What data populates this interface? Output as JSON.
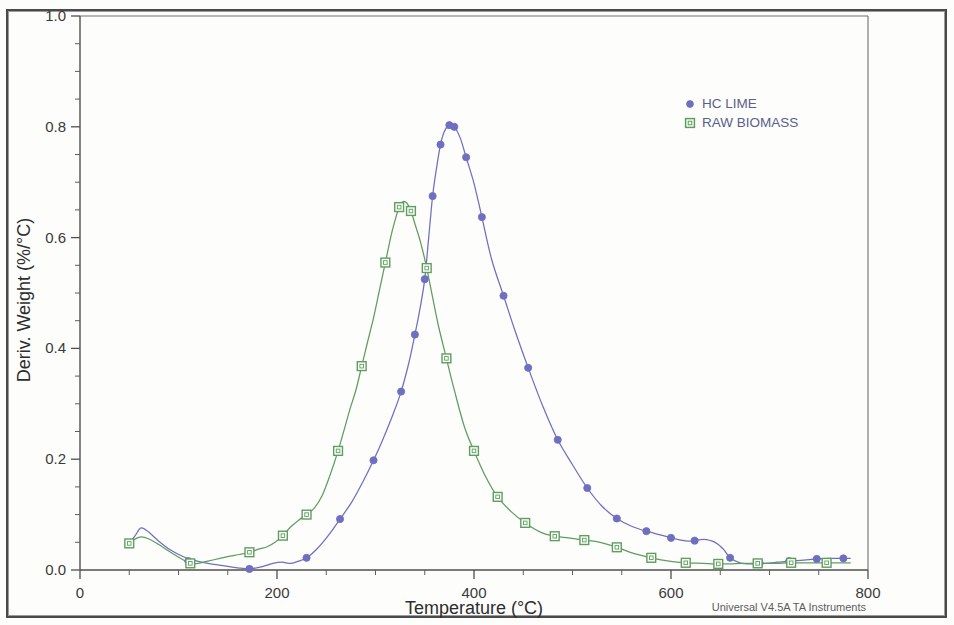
{
  "chart_data": {
    "type": "line",
    "title": "",
    "xlabel": "Temperature (°C)",
    "ylabel": "Deriv. Weight (%/°C)",
    "xlim": [
      0,
      800
    ],
    "ylim": [
      0.0,
      1.0
    ],
    "x_ticks": [
      0,
      200,
      400,
      600,
      800
    ],
    "x_tick_labels": [
      "0",
      "200",
      "400",
      "600",
      "800"
    ],
    "x_minor_interval": 50,
    "y_ticks": [
      0.0,
      0.2,
      0.4,
      0.6,
      0.8,
      1.0
    ],
    "y_tick_labels": [
      "0.0",
      "0.2",
      "0.4",
      "0.6",
      "0.8",
      "1.0"
    ],
    "y_minor_interval": 0.05,
    "grid": false,
    "legend_position": "top-right",
    "series": [
      {
        "name": "HC LIME",
        "color": "#6f6fc0",
        "marker": "filled-circle",
        "x": [
          50,
          56,
          62,
          70,
          80,
          92,
          105,
          115,
          130,
          145,
          160,
          172,
          185,
          196,
          205,
          214,
          222,
          230,
          240,
          252,
          264,
          276,
          288,
          298,
          308,
          318,
          326,
          334,
          340,
          345,
          350,
          354,
          358,
          362,
          366,
          370,
          375,
          380,
          386,
          392,
          400,
          408,
          418,
          430,
          442,
          455,
          470,
          485,
          500,
          515,
          530,
          545,
          560,
          575,
          590,
          600,
          610,
          618,
          624,
          630,
          636,
          642,
          648,
          654,
          660,
          670,
          682,
          695,
          708,
          720,
          735,
          748,
          762,
          775,
          782
        ],
        "y": [
          0.047,
          0.062,
          0.076,
          0.068,
          0.052,
          0.036,
          0.024,
          0.018,
          0.012,
          0.008,
          0.004,
          0.002,
          0.006,
          0.012,
          0.014,
          0.012,
          0.016,
          0.022,
          0.037,
          0.062,
          0.092,
          0.123,
          0.162,
          0.198,
          0.238,
          0.282,
          0.322,
          0.375,
          0.425,
          0.47,
          0.525,
          0.6,
          0.675,
          0.726,
          0.768,
          0.792,
          0.803,
          0.8,
          0.78,
          0.745,
          0.698,
          0.637,
          0.56,
          0.495,
          0.43,
          0.365,
          0.295,
          0.235,
          0.19,
          0.148,
          0.115,
          0.093,
          0.079,
          0.07,
          0.063,
          0.058,
          0.054,
          0.052,
          0.053,
          0.055,
          0.055,
          0.052,
          0.046,
          0.036,
          0.022,
          0.013,
          0.011,
          0.012,
          0.014,
          0.016,
          0.018,
          0.02,
          0.021,
          0.021,
          0.021
        ],
        "marker_x": [
          50,
          110,
          172,
          230,
          264,
          298,
          326,
          340,
          350,
          358,
          366,
          375,
          380,
          392,
          408,
          430,
          455,
          485,
          515,
          545,
          575,
          600,
          624,
          660,
          690,
          720,
          748,
          775
        ],
        "marker_y": [
          0.047,
          0.016,
          0.002,
          0.022,
          0.092,
          0.198,
          0.322,
          0.425,
          0.525,
          0.675,
          0.768,
          0.803,
          0.8,
          0.745,
          0.637,
          0.495,
          0.365,
          0.235,
          0.148,
          0.093,
          0.07,
          0.058,
          0.053,
          0.022,
          0.012,
          0.016,
          0.02,
          0.021
        ]
      },
      {
        "name": "RAW BIOMASS",
        "color": "#5d9e5d",
        "marker": "open-square",
        "x": [
          50,
          56,
          62,
          70,
          80,
          92,
          105,
          112,
          120,
          130,
          142,
          152,
          162,
          172,
          182,
          190,
          198,
          206,
          214,
          222,
          230,
          238,
          246,
          254,
          262,
          268,
          274,
          280,
          286,
          292,
          298,
          304,
          310,
          316,
          320,
          324,
          328,
          332,
          336,
          340,
          346,
          352,
          358,
          364,
          372,
          380,
          390,
          400,
          412,
          424,
          438,
          452,
          468,
          482,
          496,
          512,
          528,
          545,
          562,
          580,
          598,
          615,
          632,
          648,
          660,
          672,
          688,
          705,
          722,
          740,
          758,
          775,
          782
        ],
        "y": [
          0.048,
          0.056,
          0.06,
          0.056,
          0.046,
          0.032,
          0.018,
          0.012,
          0.012,
          0.016,
          0.021,
          0.025,
          0.028,
          0.032,
          0.038,
          0.042,
          0.05,
          0.062,
          0.078,
          0.09,
          0.1,
          0.112,
          0.135,
          0.172,
          0.215,
          0.252,
          0.29,
          0.324,
          0.368,
          0.412,
          0.455,
          0.505,
          0.555,
          0.605,
          0.632,
          0.655,
          0.665,
          0.662,
          0.648,
          0.625,
          0.59,
          0.545,
          0.492,
          0.44,
          0.382,
          0.325,
          0.26,
          0.215,
          0.168,
          0.132,
          0.105,
          0.085,
          0.068,
          0.061,
          0.058,
          0.054,
          0.05,
          0.041,
          0.03,
          0.022,
          0.016,
          0.013,
          0.012,
          0.011,
          0.011,
          0.012,
          0.012,
          0.012,
          0.013,
          0.013,
          0.013,
          0.013,
          0.013
        ],
        "marker_x": [
          50,
          112,
          172,
          206,
          230,
          262,
          286,
          310,
          324,
          336,
          352,
          372,
          400,
          424,
          452,
          482,
          512,
          545,
          580,
          615,
          648,
          688,
          722,
          758
        ],
        "marker_y": [
          0.048,
          0.012,
          0.032,
          0.062,
          0.1,
          0.215,
          0.368,
          0.555,
          0.655,
          0.648,
          0.545,
          0.382,
          0.215,
          0.132,
          0.085,
          0.061,
          0.054,
          0.041,
          0.022,
          0.013,
          0.011,
          0.012,
          0.013,
          0.013
        ]
      }
    ]
  },
  "legend": {
    "entries": [
      {
        "label": "HC LIME",
        "marker": "filled-circle",
        "color": "#6f6fc0"
      },
      {
        "label": "RAW BIOMASS",
        "marker": "open-square",
        "color": "#5d9e5d"
      }
    ]
  },
  "footer": {
    "text": "Universal V4.5A TA Instruments"
  },
  "colors": {
    "hc_lime": "#6f6fc0",
    "raw_biomass": "#5d9e5d",
    "axis": "#4f4f4f",
    "background": "#fdfdfc"
  }
}
